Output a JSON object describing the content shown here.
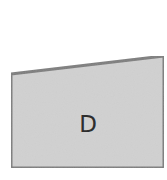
{
  "diagram": {
    "shapes": [
      {
        "id": "quad-d",
        "type": "quadrilateral",
        "label": "D",
        "points": [
          [
            11,
            74
          ],
          [
            164,
            56
          ],
          [
            164,
            168
          ],
          [
            11,
            168
          ]
        ],
        "fill": "#d2d2d2",
        "stroke": "#7a7a7a",
        "stroke_width": 3,
        "label_position": [
          88,
          125
        ]
      }
    ]
  }
}
